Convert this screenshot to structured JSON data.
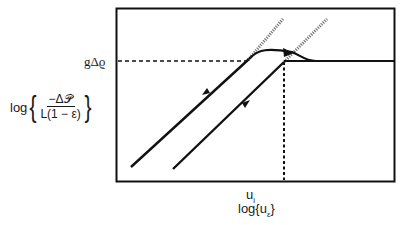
{
  "diagram": {
    "type": "hysteresis-log-log",
    "y_axis": {
      "label_prefix": "log",
      "numerator": "−Δ𝒫",
      "denominator": "L(1 − ε)",
      "marked_value": "gΔϱ"
    },
    "x_axis": {
      "label_prefix": "log{u",
      "label_sub": "ε",
      "label_suffix": "}",
      "marked_value_main": "u",
      "marked_value_sub": "i"
    },
    "curves": [
      {
        "name": "loading-line",
        "direction": "up",
        "description": "rising straight line, transitions to curved plateau with arrow to right"
      },
      {
        "name": "unloading-line",
        "direction": "down",
        "description": "descending straight line from plateau at u_i"
      },
      {
        "name": "plateau",
        "description": "horizontal line at gΔϱ extending to right boundary"
      }
    ],
    "colors": {
      "line": "#111111",
      "hatch": "#777777",
      "background": "#ffffff"
    }
  }
}
